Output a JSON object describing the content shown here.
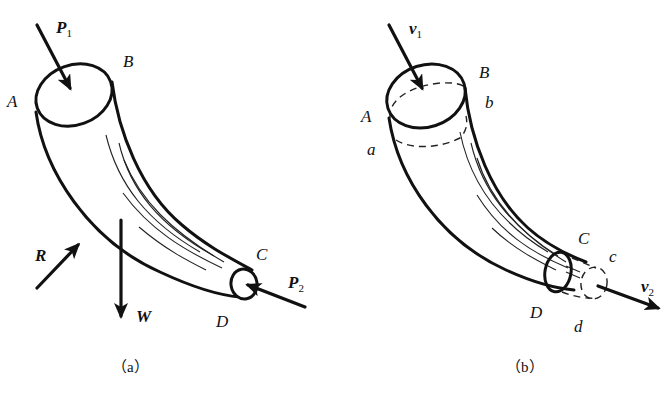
{
  "figure": {
    "panels": [
      {
        "id": "a",
        "caption": "（a）",
        "points": {
          "A": "A",
          "B": "B",
          "C": "C",
          "D": "D"
        },
        "forces": {
          "P1": {
            "main": "P",
            "sub": "1"
          },
          "P2": {
            "main": "P",
            "sub": "2"
          },
          "R": {
            "main": "R"
          },
          "W": {
            "main": "W"
          }
        }
      },
      {
        "id": "b",
        "caption": "（b）",
        "points": {
          "A": "A",
          "B": "B",
          "C": "C",
          "D": "D",
          "a": "a",
          "b": "b",
          "c": "c",
          "d": "d"
        },
        "velocities": {
          "v1": {
            "main": "v",
            "sub": "1"
          },
          "v2": {
            "main": "v",
            "sub": "2"
          }
        }
      }
    ]
  }
}
